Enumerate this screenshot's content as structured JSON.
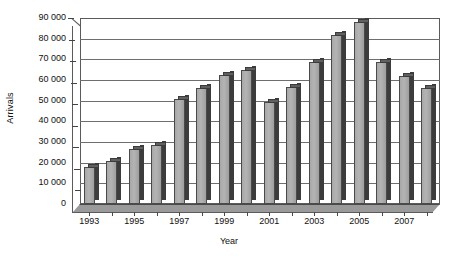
{
  "chart_data": {
    "type": "bar",
    "title": "",
    "xlabel": "Year",
    "ylabel": "Arrivals",
    "categories": [
      "1993",
      "1994",
      "1995",
      "1996",
      "1997",
      "1998",
      "1999",
      "2000",
      "2001",
      "2002",
      "2003",
      "2004",
      "2005",
      "2006",
      "2007",
      "2008"
    ],
    "values": [
      18000,
      21000,
      26500,
      28500,
      51000,
      56000,
      62500,
      65000,
      49500,
      56500,
      68500,
      82000,
      88000,
      68500,
      62000,
      56000
    ],
    "ylim": [
      0,
      90000
    ],
    "ytick_labels": [
      "90 000",
      "80 000",
      "70 000",
      "60 000",
      "50 000",
      "40 000",
      "30 000",
      "20 000",
      "10 000",
      "0"
    ],
    "ytick_values": [
      90000,
      80000,
      70000,
      60000,
      50000,
      40000,
      30000,
      20000,
      10000,
      0
    ],
    "xtick_labels": [
      "1993",
      "1995",
      "1997",
      "1999",
      "2001",
      "2003",
      "2005",
      "2007"
    ],
    "xtick_categories": [
      "1993",
      "1995",
      "1997",
      "1999",
      "2001",
      "2003",
      "2005",
      "2007"
    ],
    "grid": true,
    "legend": "none",
    "bar_fill": "#b0b0b0",
    "bar_edge": "#3c3c3c",
    "axis_color": "#5b5b5b",
    "background": "#ffffff"
  }
}
